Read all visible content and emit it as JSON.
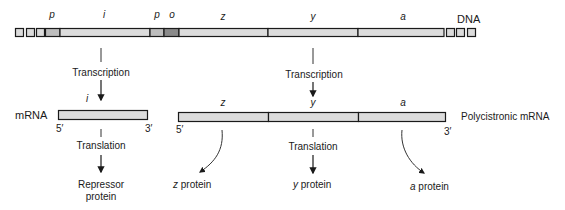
{
  "diagram": {
    "dna": {
      "label": "DNA",
      "flank_squares_left": 3,
      "flank_squares_right": 3,
      "segments": [
        {
          "name": "p",
          "label": "p",
          "x0": 45,
          "x1": 60,
          "fill": "#bdbdbd"
        },
        {
          "name": "i",
          "label": "i",
          "x0": 60,
          "x1": 150,
          "fill": "#dcdcdc"
        },
        {
          "name": "p2",
          "label": "p",
          "x0": 150,
          "x1": 164,
          "fill": "#bdbdbd"
        },
        {
          "name": "o",
          "label": "o",
          "x0": 164,
          "x1": 179,
          "fill": "#8a8a8a"
        },
        {
          "name": "z",
          "label": "z",
          "x0": 179,
          "x1": 268,
          "fill": "#dcdcdc"
        },
        {
          "name": "y",
          "label": "y",
          "x0": 268,
          "x1": 358,
          "fill": "#dcdcdc"
        },
        {
          "name": "a",
          "label": "a",
          "x0": 358,
          "x1": 444,
          "fill": "#dcdcdc"
        }
      ]
    },
    "transcription_label_left": "Transcription",
    "transcription_label_right": "Transcription",
    "mrna_left": {
      "side_label": "mRNA",
      "gene_label": "i",
      "five_prime": "5′",
      "three_prime": "3′"
    },
    "mrna_right": {
      "side_label": "Polycistronic mRNA",
      "gene_labels": [
        "z",
        "y",
        "a"
      ],
      "five_prime": "5′",
      "three_prime": "3′"
    },
    "translation_label_left": "Translation",
    "translation_label_right": "Translation",
    "products": {
      "repressor_line1": "Repressor",
      "repressor_line2": "protein",
      "z_prefix": "z",
      "z_suffix": " protein",
      "y_prefix": "y",
      "y_suffix": " protein",
      "a_prefix": "a",
      "a_suffix": " protein"
    },
    "colors": {
      "stroke": "#1a1a1a",
      "light_fill": "#dcdcdc",
      "promoter_fill": "#bdbdbd",
      "operator_fill": "#8a8a8a",
      "arrow": "#333333"
    }
  }
}
